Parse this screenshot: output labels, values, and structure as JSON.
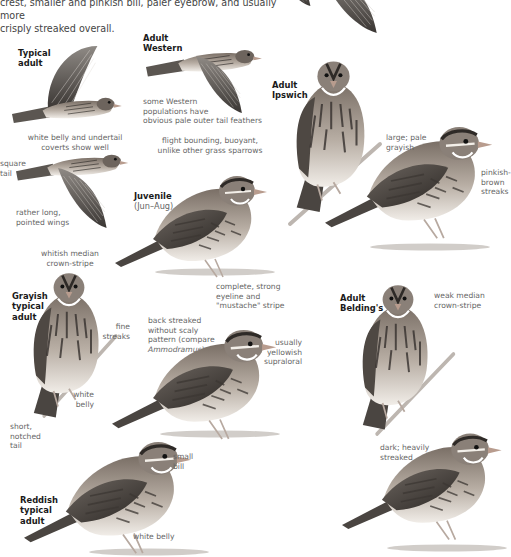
{
  "intro": {
    "line1": "crest, smaller and pinkish bill, paler eyebrow, and usually more",
    "line2": "crisply streaked overall."
  },
  "figures": {
    "typical_adult": {
      "label_1": "Typical",
      "label_2": "adult",
      "notes": {
        "belly": "white belly and undertail",
        "belly_2": "coverts show well",
        "tail": "square",
        "tail_2": "tail",
        "wings": "rather long,",
        "wings_2": "pointed wings"
      }
    },
    "adult_western": {
      "label_1": "Adult",
      "label_2": "Western",
      "notes": {
        "pale_1": "some Western",
        "pale_2": "populations have",
        "pale_3": "obvious pale outer tail feathers",
        "flight_1": "flight bounding, buoyant,",
        "flight_2": "unlike other grass sparrows"
      }
    },
    "adult_ipswich": {
      "label_1": "Adult",
      "label_2": "Ipswich",
      "notes": {
        "size_1": "large; pale",
        "size_2": "grayish",
        "streaks_1": "pinkish-",
        "streaks_2": "brown",
        "streaks_3": "streaks"
      }
    },
    "juvenile": {
      "label": "Juvenile",
      "sublabel": "(Jun–Aug)"
    },
    "grayish_typical_adult": {
      "label_1": "Grayish",
      "label_2": "typical",
      "label_3": "adult",
      "notes": {
        "crown_1": "whitish median",
        "crown_2": "crown-stripe",
        "fine_1": "fine",
        "fine_2": "streaks",
        "belly_1": "white",
        "belly_2": "belly",
        "tail_1": "short,",
        "tail_2": "notched",
        "tail_3": "tail"
      }
    },
    "center_adult": {
      "notes": {
        "eyeline_1": "complete, strong",
        "eyeline_2": "eyeline and",
        "eyeline_3": "\"mustache\" stripe",
        "back_1": "back streaked",
        "back_2": "without scaly",
        "back_3": "pattern (compare",
        "back_4": "Ammodramus)",
        "loral_1": "usually",
        "loral_2": "yellowish",
        "loral_3": "supraloral"
      }
    },
    "adult_beldings": {
      "label_1": "Adult",
      "label_2": "Belding's",
      "notes": {
        "crown_1": "weak median",
        "crown_2": "crown-stripe"
      }
    },
    "reddish_typical_adult": {
      "label_1": "Reddish",
      "label_2": "typical",
      "label_3": "adult",
      "notes": {
        "bill_1": "small",
        "bill_2": "bill",
        "belly": "white belly"
      }
    },
    "dark_form": {
      "notes": {
        "dark_1": "dark; heavily",
        "dark_2": "streaked"
      }
    }
  }
}
